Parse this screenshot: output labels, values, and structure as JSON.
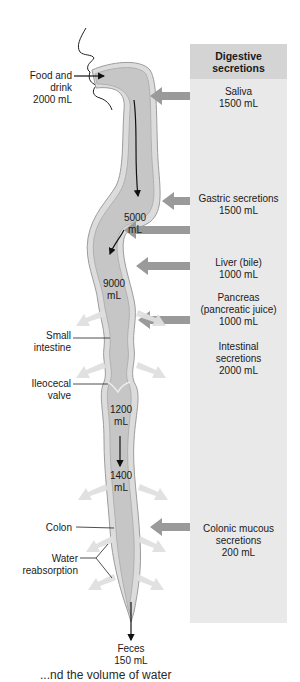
{
  "diagram": {
    "title": "Digestive secretions",
    "colors": {
      "tract_fill": "#c8c8c8",
      "tract_wall": "#a5a5a5",
      "panel_bg": "#e9e9e9",
      "panel_header_bg": "#d4d4d4",
      "secretion_arrow": "#9a9a9a",
      "reabsorption_arrow": "#e2e2e2",
      "flow_arrow": "#111111"
    },
    "intake": {
      "label": "Food and\ndrink\n2000 mL"
    },
    "secretions": [
      {
        "label": "Saliva\n1500 mL"
      },
      {
        "label": "Gastric secretions\n1500 mL"
      },
      {
        "label": "Liver (bile)\n1000 mL"
      },
      {
        "label": "Pancreas\n(pancreatic juice)\n1000 mL"
      },
      {
        "label": "Intestinal\nsecretions\n2000 mL"
      },
      {
        "label": "Colonic mucous\nsecretions\n200 mL"
      }
    ],
    "volumes": [
      {
        "label": "5000\nmL"
      },
      {
        "label": "9000\nmL"
      },
      {
        "label": "1200\nmL"
      },
      {
        "label": "1400\nmL"
      }
    ],
    "structures": [
      {
        "label": "Small\nintestine"
      },
      {
        "label": "Ileocecal\nvalve"
      },
      {
        "label": "Colon"
      },
      {
        "label": "Water\nreabsorption"
      }
    ],
    "output": {
      "label": "Feces\n150 mL"
    },
    "caption_partial": "...nd the volume of water"
  }
}
